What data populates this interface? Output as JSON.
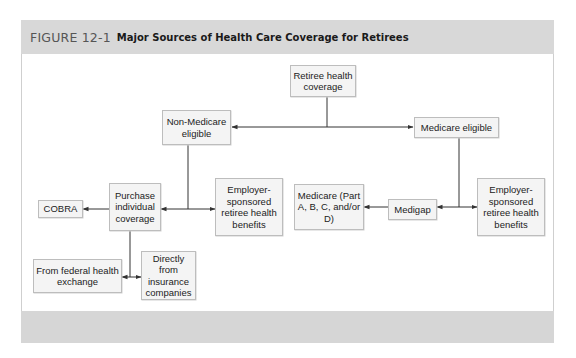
{
  "figure": {
    "number": "FIGURE 12-1",
    "title": "Major Sources of Health Care Coverage for Retirees"
  },
  "nodes": {
    "root": "Retiree health coverage",
    "non_medicare": "Non-Medicare eligible",
    "medicare_eligible": "Medicare eligible",
    "cobra": "COBRA",
    "purchase_individual": "Purchase individual coverage",
    "employer_left": "Employer-sponsored retiree health benefits",
    "medicare_parts": "Medicare (Part A, B, C, and/or D)",
    "medigap": "Medigap",
    "employer_right": "Employer-sponsored retiree health benefits",
    "federal_exchange": "From federal health exchange",
    "insurance_companies": "Directly from insurance companies"
  },
  "edges": [
    {
      "from": "Retiree health coverage",
      "to": "Non-Medicare eligible"
    },
    {
      "from": "Retiree health coverage",
      "to": "Medicare eligible"
    },
    {
      "from": "Non-Medicare eligible",
      "to": "Purchase individual coverage"
    },
    {
      "from": "Non-Medicare eligible",
      "to": "Employer-sponsored retiree health benefits"
    },
    {
      "from": "Purchase individual coverage",
      "to": "COBRA"
    },
    {
      "from": "Purchase individual coverage",
      "to": "From federal health exchange"
    },
    {
      "from": "Purchase individual coverage",
      "to": "Directly from insurance companies"
    },
    {
      "from": "Medicare eligible",
      "to": "Medigap"
    },
    {
      "from": "Medicare eligible",
      "to": "Employer-sponsored retiree health benefits"
    },
    {
      "from": "Medigap",
      "to": "Medicare (Part A, B, C, and/or D)"
    }
  ],
  "colors": {
    "header_band": "#d8d8d8",
    "footer_band": "#d6d6d6",
    "node_fill": "#f4f4f4",
    "node_border": "#bdbdbd",
    "line": "#333333"
  }
}
